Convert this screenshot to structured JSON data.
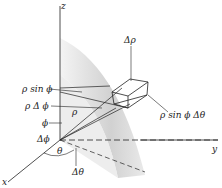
{
  "figure": {
    "type": "spherical-coordinates-volume-element",
    "axes": {
      "z": "z",
      "y": "y",
      "x": "x"
    },
    "labels": {
      "delta_rho": "Δρ",
      "rho_sin_phi": "ρ sin ϕ",
      "rho_delta_phi": "ρ Δ ϕ",
      "rho": "ρ",
      "phi": "ϕ",
      "delta_phi": "Δϕ",
      "rho_sin_phi_delta_theta": "ρ sin ϕ Δθ",
      "theta": "θ",
      "delta_theta": "Δθ"
    },
    "colors": {
      "line": "#222222",
      "shade_light": "#eeeeee",
      "shade_dark": "#bdbdbd",
      "background": "#ffffff"
    }
  }
}
